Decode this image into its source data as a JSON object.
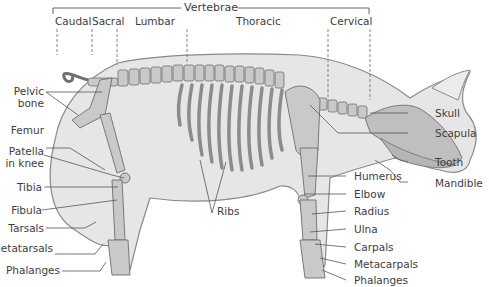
{
  "diagram": {
    "colors": {
      "body_fill": "#e6e6e6",
      "body_stroke": "#8a8a8a",
      "bone_fill": "#c9c9c9",
      "bone_stroke": "#6e6e6e",
      "leader_line": "#555555",
      "text": "#3d3d3d"
    },
    "vertebrae_bracket": {
      "title": "Vertebrae",
      "regions": [
        {
          "label": "Caudal"
        },
        {
          "label": "Sacral"
        },
        {
          "label": "Lumbar"
        },
        {
          "label": "Thoracic"
        },
        {
          "label": "Cervical"
        }
      ]
    },
    "left_labels": [
      {
        "label": "Pelvic bone"
      },
      {
        "label": "Femur"
      },
      {
        "label": "Patella in knee"
      },
      {
        "label": "Tibia"
      },
      {
        "label": "Fibula"
      },
      {
        "label": "Tarsals"
      },
      {
        "label": "Metatarsals"
      },
      {
        "label": "Phalanges"
      }
    ],
    "pelvic_line1": "Pelvic",
    "pelvic_line2": "bone",
    "patella_line1": "Patella",
    "patella_line2": "in knee",
    "center_labels": [
      {
        "label": "Ribs"
      }
    ],
    "right_labels": [
      {
        "label": "Skull"
      },
      {
        "label": "Scapula"
      },
      {
        "label": "Tooth"
      },
      {
        "label": "Mandible"
      }
    ],
    "foreleg_labels": [
      {
        "label": "Humerus"
      },
      {
        "label": "Elbow"
      },
      {
        "label": "Radius"
      },
      {
        "label": "Ulna"
      },
      {
        "label": "Carpals"
      },
      {
        "label": "Metacarpals"
      },
      {
        "label": "Phalanges"
      }
    ]
  }
}
